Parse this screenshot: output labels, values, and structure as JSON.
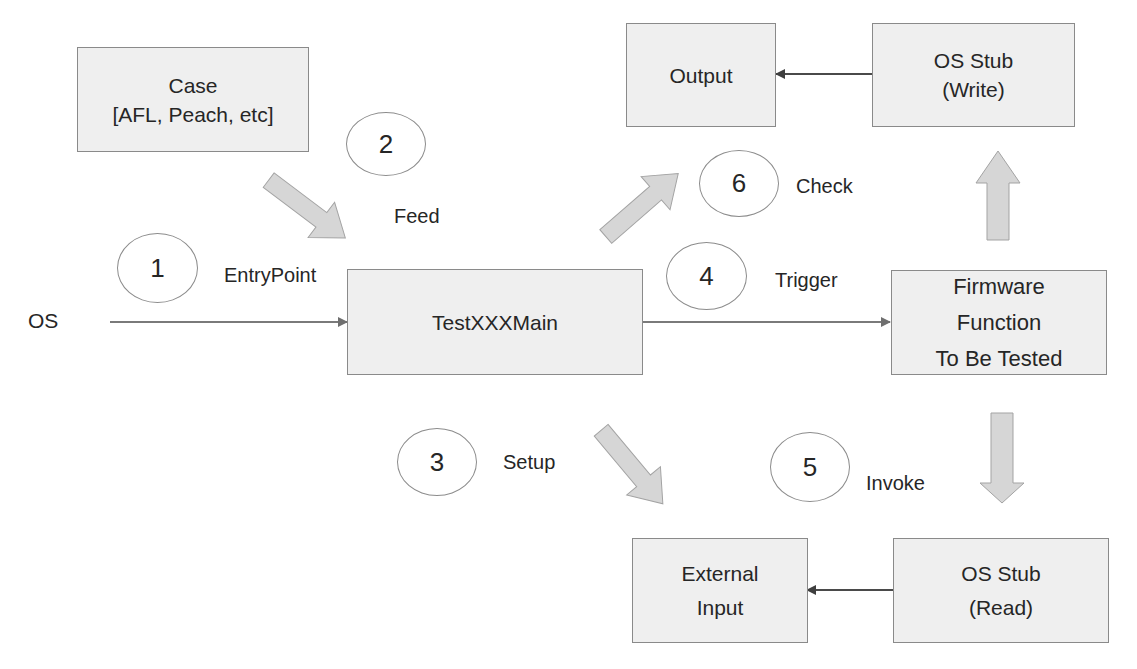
{
  "diagram": {
    "nodes": {
      "case": {
        "lines": [
          "Case",
          "[AFL, Peach, etc]"
        ]
      },
      "test_main": {
        "lines": [
          "TestXXXMain"
        ]
      },
      "output": {
        "lines": [
          "Output"
        ]
      },
      "os_stub_write": {
        "lines": [
          "OS Stub",
          "(Write)"
        ]
      },
      "firmware": {
        "lines": [
          "Firmware",
          "Function",
          "To Be Tested"
        ]
      },
      "external_input": {
        "lines": [
          "External",
          "Input"
        ]
      },
      "os_stub_read": {
        "lines": [
          "OS Stub",
          "(Read)"
        ]
      }
    },
    "os_label": "OS",
    "steps": [
      {
        "number": "1",
        "label": "EntryPoint"
      },
      {
        "number": "2",
        "label": "Feed"
      },
      {
        "number": "3",
        "label": "Setup"
      },
      {
        "number": "4",
        "label": "Trigger"
      },
      {
        "number": "5",
        "label": "Invoke"
      },
      {
        "number": "6",
        "label": "Check"
      }
    ],
    "colors": {
      "box_fill": "#efefef",
      "box_border": "#8a8a8a",
      "block_arrow_fill": "#d6d6d6",
      "line_arrow": "#7a7a7a",
      "text": "#262626"
    }
  }
}
